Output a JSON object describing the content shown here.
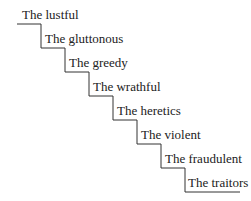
{
  "diagram": {
    "type": "staircase",
    "steps": [
      {
        "label": "The lustful"
      },
      {
        "label": "The gluttonous"
      },
      {
        "label": "The greedy"
      },
      {
        "label": "The wrathful"
      },
      {
        "label": "The heretics"
      },
      {
        "label": "The violent"
      },
      {
        "label": "The fraudulent"
      },
      {
        "label": "The traitors"
      }
    ],
    "line_color": "#333333"
  }
}
